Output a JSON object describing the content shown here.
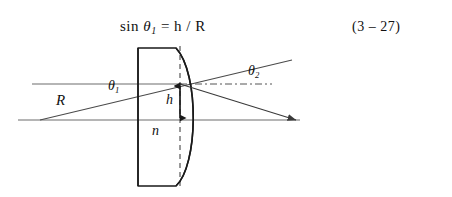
{
  "figure": {
    "formula": {
      "fn": "sin",
      "theta": "θ",
      "theta_sub": "1",
      "equals_rhs": "= h / R"
    },
    "equation_number": "(3 – 27)",
    "labels": {
      "radius": "R",
      "theta1": "θ",
      "theta1_sub": "1",
      "theta2": "θ",
      "theta2_sub": "2",
      "height": "h",
      "refractive_index": "n"
    },
    "colors": {
      "ink": "#111111",
      "ray": "#4a4a4a",
      "lens_outline": "#1a1a1a",
      "dashed": "#333333",
      "background": "#ffffff"
    },
    "geometry": {
      "optical_axis_y": 120,
      "incident_ray_y": 84,
      "lens_flat_edge_x": 138,
      "lens_apex_x": 180,
      "lens_top_y": 48,
      "lens_bottom_y": 186,
      "dashed_normal_x": 180,
      "focus_x": 296,
      "ray_origin_x": 40
    }
  }
}
